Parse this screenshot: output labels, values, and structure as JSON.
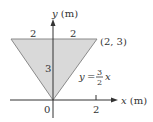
{
  "diagram": {
    "type": "triangular region in xy-plane",
    "y_axis_label_var": "y",
    "y_axis_label_unit": "(m)",
    "x_axis_label_var": "x",
    "x_axis_label_unit": "(m)",
    "origin_label": "0",
    "x_tick_label": "2",
    "top_left_width_label": "2",
    "top_right_width_label": "2",
    "height_label": "3",
    "vertex_label": "(2, 3)",
    "equation": {
      "lhs": "y",
      "eq": "=",
      "numerator": "3",
      "denominator": "2",
      "var": "x"
    },
    "colors": {
      "fill": "#d9d9d9",
      "edge": "#8a8a8a",
      "axis": "#333333"
    },
    "vertices": [
      [
        -2,
        3
      ],
      [
        2,
        3
      ],
      [
        0,
        0
      ]
    ]
  }
}
